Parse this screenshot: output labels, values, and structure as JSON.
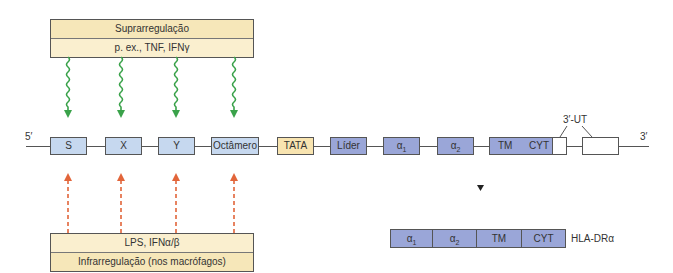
{
  "upregulation": {
    "title": "Suprarregulação",
    "examples": "p. ex., TNF, IFNγ",
    "arrow_color": "#3aa24a"
  },
  "downregulation": {
    "examples": "LPS, IFNα/β",
    "title": "Infrarregulação (nos macrófagos)",
    "arrow_color": "#e2653a"
  },
  "gene": {
    "five_prime": "5′",
    "three_prime": "3′",
    "utr_label": "3′-UT",
    "promoter_elements": [
      "S",
      "X",
      "Y",
      "Octâmero"
    ],
    "tata": "TATA",
    "exons": {
      "leader": "Líder",
      "alpha1": "α",
      "alpha1_sub": "1",
      "alpha2": "α",
      "alpha2_sub": "2",
      "tm": "TM",
      "cyt": "CYT"
    }
  },
  "protein": {
    "domains": {
      "alpha1": "α",
      "alpha1_sub": "1",
      "alpha2": "α",
      "alpha2_sub": "2",
      "tm": "TM",
      "cyt": "CYT"
    },
    "name": "HLA-DRα"
  },
  "colors": {
    "promoter_fill": "#c6d8ef",
    "tata_fill": "#f8e4b0",
    "exon_fill": "#9aa6d8",
    "regbox_fill": "#f8ecc4"
  }
}
